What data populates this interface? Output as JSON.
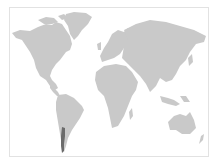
{
  "map": {
    "type": "world-choropleth",
    "highlighted_region": "Chile",
    "colors": {
      "land": "#c9c9c9",
      "highlight": "#6b6b6b",
      "background": "#ffffff",
      "frame": "#e2e2e2"
    },
    "regions": [
      "north-america",
      "greenland",
      "south-america",
      "europe",
      "africa",
      "asia",
      "australia",
      "new-zealand",
      "chile"
    ]
  }
}
